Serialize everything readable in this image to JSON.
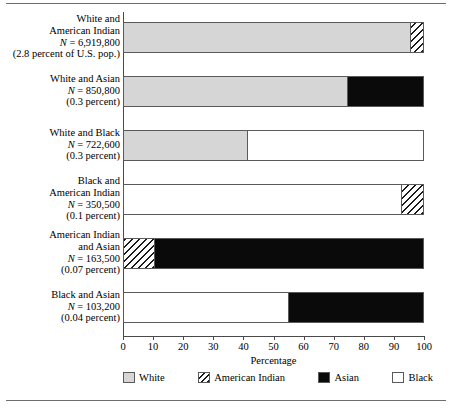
{
  "chart_data": {
    "type": "bar",
    "orientation": "horizontal",
    "stacked": true,
    "title": "",
    "xlabel": "Percentage",
    "ylabel": "",
    "xlim": [
      0,
      100
    ],
    "xticks": [
      0,
      10,
      20,
      30,
      40,
      50,
      60,
      70,
      80,
      90,
      100
    ],
    "grid": false,
    "legend_position": "bottom",
    "legend": [
      {
        "name": "White",
        "key": "white",
        "pattern": "solid-gray",
        "color": "#d6d6d6"
      },
      {
        "name": "American Indian",
        "key": "american_indian",
        "pattern": "diagonal-hatch",
        "color": "#ffffff"
      },
      {
        "name": "Asian",
        "key": "asian",
        "pattern": "solid-black",
        "color": "#0a0a0a"
      },
      {
        "name": "Black",
        "key": "black",
        "pattern": "solid-white",
        "color": "#ffffff"
      }
    ],
    "categories": [
      "White and American Indian",
      "White and Asian",
      "White and Black",
      "Black and American Indian",
      "American Indian and Asian",
      "Black and Asian"
    ],
    "series": [
      {
        "name": "White",
        "key": "white",
        "values": [
          95.7,
          74.5,
          41.0,
          0,
          0,
          0
        ]
      },
      {
        "name": "American Indian",
        "key": "american_indian",
        "values": [
          4.3,
          0,
          0,
          7.3,
          10.0,
          0
        ]
      },
      {
        "name": "Asian",
        "key": "asian",
        "values": [
          0,
          25.5,
          0,
          0,
          90.0,
          45.0
        ]
      },
      {
        "name": "Black",
        "key": "black",
        "values": [
          0,
          0,
          59.0,
          92.7,
          0,
          55.0
        ]
      }
    ],
    "rows": [
      {
        "label_lines": [
          "White and",
          "American Indian"
        ],
        "n_label": "N = 6,919,800",
        "n_prefix": "N",
        "n_value": " = 6,919,800",
        "percent_label": "(2.8 percent of U.S. pop.)",
        "n": 6919800,
        "percent_of_us_pop": 2.8,
        "segments": [
          {
            "key": "white",
            "name": "White",
            "value": 95.7
          },
          {
            "key": "american_indian",
            "name": "American Indian",
            "value": 4.3
          }
        ]
      },
      {
        "label_lines": [
          "White and Asian"
        ],
        "n_label": "N = 850,800",
        "n_prefix": "N",
        "n_value": " = 850,800",
        "percent_label": "(0.3 percent)",
        "n": 850800,
        "percent_of_us_pop": 0.3,
        "segments": [
          {
            "key": "white",
            "name": "White",
            "value": 74.5
          },
          {
            "key": "asian",
            "name": "Asian",
            "value": 25.5
          }
        ]
      },
      {
        "label_lines": [
          "White and Black"
        ],
        "n_label": "N = 722,600",
        "n_prefix": "N",
        "n_value": " = 722,600",
        "percent_label": "(0.3 percent)",
        "n": 722600,
        "percent_of_us_pop": 0.3,
        "segments": [
          {
            "key": "white",
            "name": "White",
            "value": 41.0
          },
          {
            "key": "black",
            "name": "Black",
            "value": 59.0
          }
        ]
      },
      {
        "label_lines": [
          "Black and",
          "American Indian"
        ],
        "n_label": "N = 350,500",
        "n_prefix": "N",
        "n_value": " = 350,500",
        "percent_label": "(0.1 percent)",
        "n": 350500,
        "percent_of_us_pop": 0.1,
        "segments": [
          {
            "key": "black",
            "name": "Black",
            "value": 92.7
          },
          {
            "key": "american_indian",
            "name": "American Indian",
            "value": 7.3
          }
        ]
      },
      {
        "label_lines": [
          "American Indian",
          "and Asian"
        ],
        "n_label": "N = 163,500",
        "n_prefix": "N",
        "n_value": " = 163,500",
        "percent_label": "(0.07 percent)",
        "n": 163500,
        "percent_of_us_pop": 0.07,
        "segments": [
          {
            "key": "american_indian",
            "name": "American Indian",
            "value": 10.0
          },
          {
            "key": "asian",
            "name": "Asian",
            "value": 90.0
          }
        ]
      },
      {
        "label_lines": [
          "Black and Asian"
        ],
        "n_label": "N = 103,200",
        "n_prefix": "N",
        "n_value": " = 103,200",
        "percent_label": "(0.04 percent)",
        "n": 103200,
        "percent_of_us_pop": 0.04,
        "segments": [
          {
            "key": "black",
            "name": "Black",
            "value": 55.0
          },
          {
            "key": "asian",
            "name": "Asian",
            "value": 45.0
          }
        ]
      }
    ]
  }
}
